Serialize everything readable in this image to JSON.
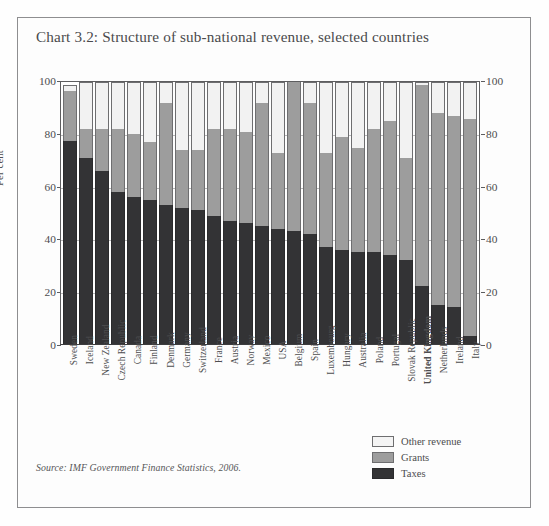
{
  "chart_data": {
    "type": "bar",
    "subtype": "stacked-bar-100",
    "title": "Chart 3.2: Structure of sub-national revenue, selected countries",
    "xlabel": "",
    "ylabel": "Per cent",
    "ylim": [
      0,
      100
    ],
    "yticks": [
      0,
      20,
      40,
      60,
      80,
      100
    ],
    "ytick_labels": [
      "0",
      "20",
      "40",
      "60",
      "80",
      "100"
    ],
    "grid": true,
    "dual_axis": true,
    "legend_position": "bottom-right",
    "source": "Source: IMF Government Finance Statistics, 2006.",
    "categories": [
      "Sweden",
      "Iceland",
      "New Zealand",
      "Czech Republic",
      "Canada",
      "Finland",
      "Denmark",
      "Germany",
      "Switzerland",
      "France",
      "Austria",
      "Norway",
      "Mexico",
      "USA",
      "Belgium",
      "Spain",
      "Luxembourg",
      "Hungary",
      "Australia",
      "Poland",
      "Portugal",
      "Slovak Republic",
      "United Kingdom",
      "Netherlands",
      "Ireland",
      "Italy"
    ],
    "series": [
      {
        "name": "Taxes",
        "color": "#333335",
        "values": [
          77,
          71,
          66,
          58,
          56,
          55,
          53,
          52,
          51,
          49,
          47,
          46,
          45,
          44,
          43,
          42,
          37,
          36,
          35,
          35,
          34,
          32,
          22,
          15,
          14,
          3
        ]
      },
      {
        "name": "Grants",
        "color": "#9d9d9d",
        "values": [
          19,
          11,
          16,
          24,
          24,
          22,
          39,
          22,
          23,
          33,
          35,
          35,
          47,
          29,
          57,
          50,
          36,
          43,
          40,
          47,
          51,
          39,
          77,
          73,
          73,
          83
        ]
      },
      {
        "name": "Other revenue",
        "color": "#f2f2f2",
        "values": [
          2,
          18,
          18,
          18,
          20,
          23,
          8,
          26,
          26,
          18,
          18,
          19,
          8,
          27,
          0,
          8,
          27,
          21,
          25,
          18,
          15,
          29,
          1,
          12,
          13,
          14
        ]
      }
    ],
    "stack_totals": [
      98,
      100,
      100,
      100,
      100,
      100,
      100,
      100,
      100,
      100,
      100,
      100,
      100,
      100,
      100,
      100,
      100,
      100,
      100,
      100,
      100,
      100,
      100,
      100,
      100,
      100
    ]
  },
  "legend": {
    "items": [
      {
        "label": "Other revenue",
        "key": "other"
      },
      {
        "label": "Grants",
        "key": "grants"
      },
      {
        "label": "Taxes",
        "key": "taxes"
      }
    ]
  },
  "colors": {
    "taxes": "#333335",
    "grants": "#9d9d9d",
    "other_revenue": "#f2f2f2",
    "frame": "#8e8e90",
    "text": "#4d4d4f"
  }
}
